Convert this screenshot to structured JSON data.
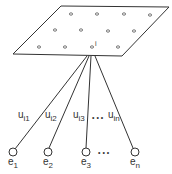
{
  "diagram": {
    "type": "network-node-connections",
    "plane": {
      "corners": [
        [
          61,
          6
        ],
        [
          169,
          7
        ],
        [
          122,
          56
        ],
        [
          13,
          54
        ]
      ],
      "grid_nodes": [
        [
          71,
          14
        ],
        [
          97,
          14
        ],
        [
          124,
          14
        ],
        [
          150,
          15
        ],
        [
          55,
          30
        ],
        [
          81,
          30
        ],
        [
          108,
          31
        ],
        [
          134,
          31
        ],
        [
          39,
          47
        ],
        [
          65,
          47
        ],
        [
          92,
          47
        ],
        [
          118,
          47
        ]
      ],
      "center_node_label": "i"
    },
    "connections": [
      {
        "from": [
          87,
          56
        ],
        "to": [
          13,
          148
        ],
        "weight_main": "u",
        "weight_sub": "i1"
      },
      {
        "from": [
          89,
          56
        ],
        "to": [
          48,
          148
        ],
        "weight_main": "u",
        "weight_sub": "i2"
      },
      {
        "from": [
          91,
          56
        ],
        "to": [
          86,
          148
        ],
        "weight_main": "u",
        "weight_sub": "i3"
      },
      {
        "from": [
          95,
          56
        ],
        "to": [
          135,
          148
        ],
        "weight_main": "u",
        "weight_sub": "in"
      }
    ],
    "weight_ellipsis": "• • •",
    "output_nodes": [
      {
        "cx": 13,
        "cy": 152,
        "main": "e",
        "sub": "1"
      },
      {
        "cx": 48,
        "cy": 152,
        "main": "e",
        "sub": "2"
      },
      {
        "cx": 86,
        "cy": 152,
        "main": "e",
        "sub": "3"
      },
      {
        "cx": 135,
        "cy": 152,
        "main": "e",
        "sub": "n"
      }
    ],
    "node_ellipsis": "•   •   •",
    "colors": {
      "stroke": "#333333",
      "background": "#ffffff"
    }
  }
}
